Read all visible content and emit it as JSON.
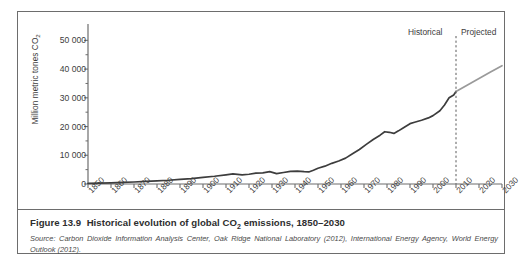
{
  "figure": {
    "caption_prefix": "Figure 13.9",
    "caption_text": "Historical evolution of global CO",
    "caption_sub": "2",
    "caption_tail": " emissions, 1850–2030",
    "source_prefix": "Source:",
    "source_text": "Carbon Dioxide Information Analysis Center, Oak Ridge National Laboratory (2012), International Energy Agency, World Energy Outlook (2012)."
  },
  "annotations": {
    "historical": "Historical",
    "projected": "Projected",
    "divider_year": 2010
  },
  "colors": {
    "historical_line": "#3d3d3d",
    "projected_line": "#9a9a9a",
    "axis": "#6d6d6d",
    "frame": "#6d6d6d",
    "text": "#3c3c3c"
  },
  "chart_data": {
    "type": "line",
    "title": "Historical evolution of global CO2 emissions, 1850–2030",
    "xlabel": "",
    "ylabel": "Million metric tones CO2",
    "xlim": [
      1850,
      2030
    ],
    "ylim": [
      0,
      55000
    ],
    "grid": false,
    "legend": "none",
    "ytick_values": [
      0,
      10000,
      20000,
      30000,
      40000,
      50000
    ],
    "ytick_labels": [
      "0",
      "10 000",
      "20 000",
      "30 000",
      "40 000",
      "50 000"
    ],
    "yminor_step": 5000,
    "xtick_values": [
      1850,
      1860,
      1870,
      1880,
      1890,
      1900,
      1910,
      1920,
      1930,
      1940,
      1950,
      1960,
      1970,
      1980,
      1990,
      2000,
      2010,
      2020,
      2030
    ],
    "xtick_labels": [
      "1850",
      "1860",
      "1870",
      "1880",
      "1890",
      "1900",
      "1910",
      "1920",
      "1930",
      "1940",
      "1950",
      "1960",
      "1970",
      "1980",
      "1990",
      "2000",
      "2010",
      "2020",
      "2030"
    ],
    "series": [
      {
        "name": "Historical",
        "color": "#3d3d3d",
        "x": [
          1850,
          1855,
          1860,
          1865,
          1870,
          1875,
          1880,
          1885,
          1890,
          1895,
          1900,
          1905,
          1910,
          1913,
          1917,
          1920,
          1923,
          1926,
          1929,
          1932,
          1935,
          1938,
          1941,
          1944,
          1946,
          1948,
          1950,
          1953,
          1956,
          1959,
          1962,
          1965,
          1968,
          1971,
          1974,
          1977,
          1979,
          1981,
          1983,
          1985,
          1987,
          1990,
          1992,
          1995,
          1998,
          2000,
          2003,
          2005,
          2007,
          2009,
          2010
        ],
        "y": [
          200,
          300,
          400,
          550,
          700,
          900,
          1100,
          1300,
          1600,
          1900,
          2300,
          2700,
          3200,
          3500,
          3200,
          3400,
          3800,
          3900,
          4300,
          3600,
          4000,
          4400,
          4500,
          4300,
          4200,
          4800,
          5500,
          6200,
          7200,
          8000,
          9000,
          10500,
          12000,
          13800,
          15500,
          17000,
          18200,
          18000,
          17600,
          18500,
          19500,
          21000,
          21500,
          22200,
          23000,
          23800,
          25500,
          27500,
          30000,
          31000,
          32200
        ]
      },
      {
        "name": "Projected",
        "color": "#9a9a9a",
        "x": [
          2010,
          2015,
          2020,
          2025,
          2030
        ],
        "y": [
          32200,
          34500,
          36700,
          39000,
          41200
        ]
      }
    ]
  }
}
